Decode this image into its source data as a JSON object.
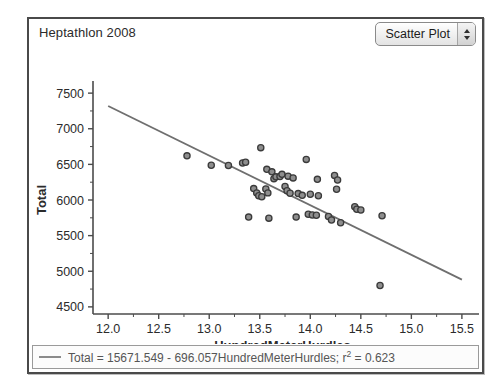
{
  "window": {
    "title": "Heptathlon 2008"
  },
  "plot_type_menu": {
    "selected": "Scatter Plot",
    "stepper_icon": "up-down-stepper-icon"
  },
  "legend": {
    "swatch_icon": "line-swatch-icon",
    "equation_prefix": "Total = 15671.549 - 696.057HundredMeterHurdles; r",
    "exponent": "2",
    "equation_suffix": " = 0.623"
  },
  "colors": {
    "frame": "#4a4a4a",
    "axis": "#4b4b4b",
    "point_stroke": "#3a3a3a",
    "point_fill": "#8e8e8e",
    "fit_line": "#6f6f6f",
    "legend_text": "#555555",
    "title_text": "#2b2b2b"
  },
  "chart_data": {
    "type": "scatter",
    "title": "Heptathlon 2008",
    "xlabel": "HundredMeterHurdles",
    "ylabel": "Total",
    "xlim": [
      11.85,
      15.6
    ],
    "ylim": [
      4400,
      7600
    ],
    "xticks": [
      12.0,
      12.5,
      13.0,
      13.5,
      14.0,
      14.5,
      15.0,
      15.5
    ],
    "xtick_labels": [
      "12.0",
      "12.5",
      "13.0",
      "13.5",
      "14.0",
      "14.5",
      "15.0",
      "15.5"
    ],
    "yticks": [
      4500,
      5000,
      5500,
      6000,
      6500,
      7000,
      7500
    ],
    "ytick_labels": [
      "4500",
      "5000",
      "5500",
      "6000",
      "6500",
      "7000",
      "7500"
    ],
    "minor_ticks": true,
    "grid": false,
    "legend_position": "bottom",
    "fit": {
      "type": "linear",
      "intercept": 15671.549,
      "slope": -696.057,
      "r_squared": 0.623,
      "label": "Total = 15671.549 - 696.057HundredMeterHurdles; r2 = 0.623",
      "x_start": 12.0,
      "x_end": 15.5
    },
    "points": [
      {
        "x": 12.78,
        "y": 6620
      },
      {
        "x": 13.02,
        "y": 6487
      },
      {
        "x": 13.19,
        "y": 6484
      },
      {
        "x": 13.33,
        "y": 6520
      },
      {
        "x": 13.36,
        "y": 6530
      },
      {
        "x": 13.51,
        "y": 6735
      },
      {
        "x": 13.96,
        "y": 6570
      },
      {
        "x": 13.57,
        "y": 6430
      },
      {
        "x": 13.62,
        "y": 6395
      },
      {
        "x": 13.64,
        "y": 6300
      },
      {
        "x": 13.66,
        "y": 6325
      },
      {
        "x": 13.7,
        "y": 6330
      },
      {
        "x": 13.72,
        "y": 6360
      },
      {
        "x": 13.78,
        "y": 6335
      },
      {
        "x": 13.83,
        "y": 6310
      },
      {
        "x": 14.07,
        "y": 6290
      },
      {
        "x": 14.24,
        "y": 6345
      },
      {
        "x": 14.27,
        "y": 6280
      },
      {
        "x": 14.26,
        "y": 6150
      },
      {
        "x": 13.44,
        "y": 6160
      },
      {
        "x": 13.47,
        "y": 6100
      },
      {
        "x": 13.49,
        "y": 6060
      },
      {
        "x": 13.52,
        "y": 6045
      },
      {
        "x": 13.56,
        "y": 6155
      },
      {
        "x": 13.58,
        "y": 6100
      },
      {
        "x": 13.75,
        "y": 6190
      },
      {
        "x": 13.77,
        "y": 6130
      },
      {
        "x": 13.8,
        "y": 6095
      },
      {
        "x": 13.88,
        "y": 6090
      },
      {
        "x": 13.92,
        "y": 6065
      },
      {
        "x": 14.0,
        "y": 6080
      },
      {
        "x": 14.08,
        "y": 6060
      },
      {
        "x": 14.44,
        "y": 5905
      },
      {
        "x": 14.46,
        "y": 5870
      },
      {
        "x": 14.5,
        "y": 5860
      },
      {
        "x": 14.71,
        "y": 5780
      },
      {
        "x": 13.39,
        "y": 5760
      },
      {
        "x": 13.59,
        "y": 5745
      },
      {
        "x": 13.86,
        "y": 5760
      },
      {
        "x": 13.98,
        "y": 5800
      },
      {
        "x": 14.02,
        "y": 5790
      },
      {
        "x": 14.06,
        "y": 5785
      },
      {
        "x": 14.18,
        "y": 5770
      },
      {
        "x": 14.21,
        "y": 5720
      },
      {
        "x": 14.3,
        "y": 5680
      },
      {
        "x": 14.69,
        "y": 4800
      }
    ]
  }
}
